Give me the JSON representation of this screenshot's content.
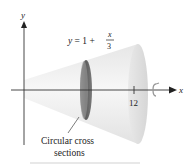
{
  "figure": {
    "type": "solid-of-revolution",
    "axes": {
      "x_label": "x",
      "y_label": "y",
      "x_tick": "12"
    },
    "curve_label": {
      "lhs": "y = 1 +",
      "frac_num": "x",
      "frac_den": "3"
    },
    "annotation": {
      "line1": "Circular cross",
      "line2": "sections"
    },
    "rotation_icon": "rotation-arrow-icon",
    "colors": {
      "cone_light": "#f2f2f2",
      "cone_shade": "#d9d9d9",
      "disk": "#6e6e6e",
      "axis": "#333333"
    }
  }
}
